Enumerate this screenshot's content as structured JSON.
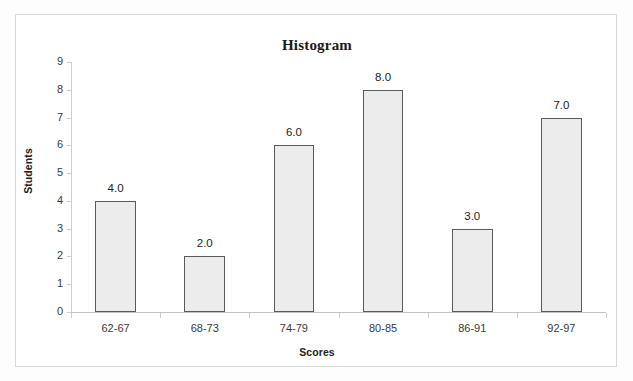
{
  "chart_data": {
    "type": "bar",
    "title": "Histogram",
    "xlabel": "Scores",
    "ylabel": "Students",
    "categories": [
      "62-67",
      "68-73",
      "74-79",
      "80-85",
      "86-91",
      "92-97"
    ],
    "values": [
      4,
      2,
      6,
      8,
      3,
      7
    ],
    "value_labels": [
      "4.0",
      "2.0",
      "6.0",
      "8.0",
      "3.0",
      "7.0"
    ],
    "ylim": [
      0,
      9
    ],
    "y_ticks": [
      "0",
      "1",
      "2",
      "3",
      "4",
      "5",
      "6",
      "7",
      "8",
      "9"
    ],
    "grid": false,
    "legend": "none",
    "bar_fill_color": "#ececed",
    "bar_border_color": "#5a5a5a",
    "axis_color": "#c8c8c8",
    "text_color": "#222222",
    "plot_background": "#ffffff"
  }
}
